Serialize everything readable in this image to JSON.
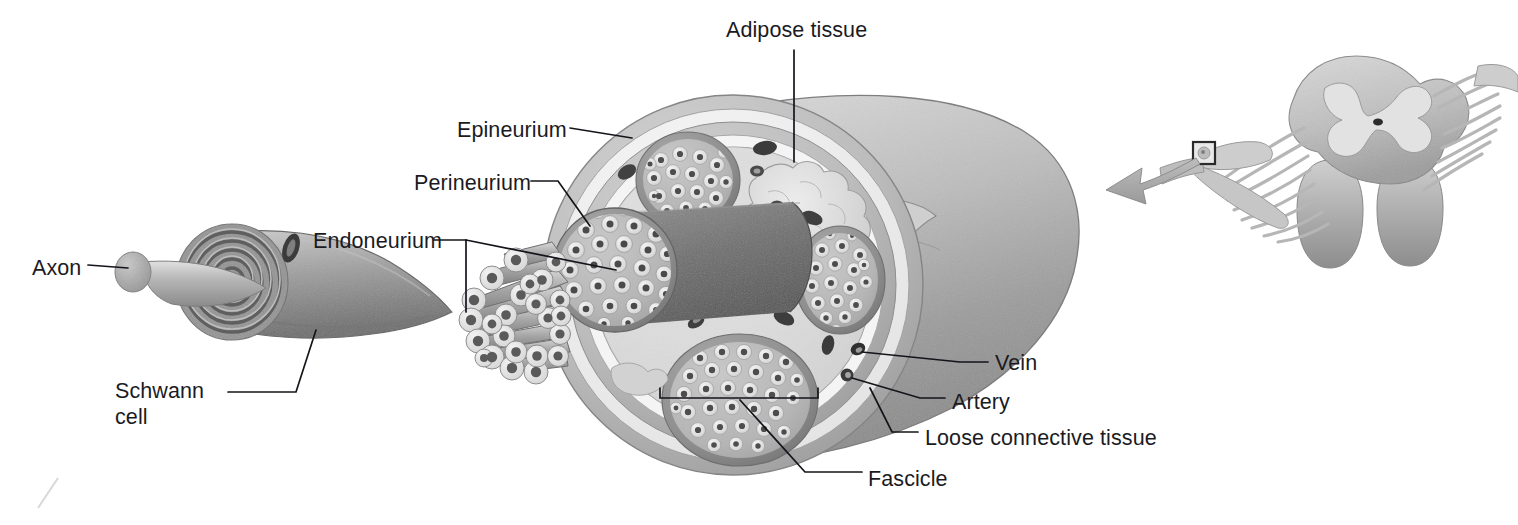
{
  "figure": {
    "background_color": "#ffffff",
    "label_color": "#1b1b1f",
    "leader_line_color": "#14141a",
    "palette": {
      "epineurium_outer_rim": "#b4b4b4",
      "epineurium_pale_band": "#efefef",
      "epineurium_fill": "#dcdcdc",
      "perineurium_ring": "#8f8f8f",
      "endoneurium_fill": "#b9b9b9",
      "myelin_ring": "#e2e2e2",
      "axon_core": "#4a4a4a",
      "vessel_dark": "#3a3a3a",
      "nerve_trunk": "#b0b0b0",
      "adipose": "#d6d6d6",
      "arrow_gray": "#a9a9a9",
      "spinal_cord_gray": "#c2c2c2"
    }
  },
  "labels": [
    {
      "id": "axon",
      "text": "Axon",
      "x": 32,
      "y": 255,
      "lines": [
        "Axon"
      ]
    },
    {
      "id": "schwann-cell",
      "text": "Schwann cell",
      "x": 115,
      "y": 378,
      "lines": [
        "Schwann",
        "cell"
      ]
    },
    {
      "id": "endoneurium",
      "text": "Endoneurium",
      "x": 313,
      "y": 228,
      "lines": [
        "Endoneurium"
      ]
    },
    {
      "id": "perineurium",
      "text": "Perineurium",
      "x": 414,
      "y": 170,
      "lines": [
        "Perineurium"
      ]
    },
    {
      "id": "epineurium",
      "text": "Epineurium",
      "x": 457,
      "y": 117,
      "lines": [
        "Epineurium"
      ]
    },
    {
      "id": "adipose-tissue",
      "text": "Adipose tissue",
      "x": 726,
      "y": 17,
      "lines": [
        "Adipose tissue"
      ]
    },
    {
      "id": "vein",
      "text": "Vein",
      "x": 995,
      "y": 350,
      "lines": [
        "Vein"
      ]
    },
    {
      "id": "artery",
      "text": "Artery",
      "x": 952,
      "y": 389,
      "lines": [
        "Artery"
      ]
    },
    {
      "id": "loose-connective-tissue",
      "text": "Loose connective tissue",
      "x": 925,
      "y": 425,
      "lines": [
        "Loose connective tissue"
      ]
    },
    {
      "id": "fascicle",
      "text": "Fascicle",
      "x": 868,
      "y": 466,
      "lines": [
        "Fascicle"
      ]
    }
  ],
  "structures": {
    "nerve_cross_section": {
      "name": "nerve-cross-section",
      "center": [
        733,
        285
      ],
      "radius": 190,
      "fascicle_count": 4,
      "layers": [
        "epineurium",
        "loose connective tissue",
        "perineurium",
        "endoneurium"
      ]
    },
    "fascicles": [
      {
        "name": "fascicle-top-left",
        "cx": 688,
        "cy": 180,
        "rx": 52,
        "ry": 48,
        "axons": 20
      },
      {
        "name": "fascicle-cut-end",
        "cx": 615,
        "cy": 270,
        "rx": 62,
        "ry": 62,
        "axons": 29
      },
      {
        "name": "fascicle-right",
        "cx": 840,
        "cy": 280,
        "rx": 45,
        "ry": 54,
        "axons": 20
      },
      {
        "name": "fascicle-bottom",
        "cx": 740,
        "cy": 400,
        "rx": 78,
        "ry": 66,
        "axons": 33
      }
    ],
    "adipose_tissue": {
      "name": "adipose-tissue-mass",
      "cx": 800,
      "cy": 195
    },
    "vessels": [
      {
        "name": "vein-labeled",
        "cx": 858,
        "cy": 349,
        "type": "vein"
      },
      {
        "name": "artery-labeled",
        "cx": 847,
        "cy": 375,
        "type": "artery"
      }
    ],
    "myelinated_fiber": {
      "name": "schwann-cell-myelinated-axon",
      "axon_tip": [
        133,
        272
      ],
      "myelin_wraps": 5
    },
    "fiber_bundle": {
      "name": "splayed-nerve-fiber-bundle",
      "fiber_count": 24
    },
    "spinal_cord_inset": {
      "name": "spinal-cord-segment",
      "cx": 1355,
      "cy": 110,
      "callout_box": [
        1193,
        142,
        22,
        22
      ],
      "arrow": {
        "from": [
          1205,
          155
        ],
        "to": [
          1100,
          175
        ]
      }
    }
  },
  "artifact": {
    "name": "scan-artifact-mark",
    "x": 38,
    "y": 478
  }
}
